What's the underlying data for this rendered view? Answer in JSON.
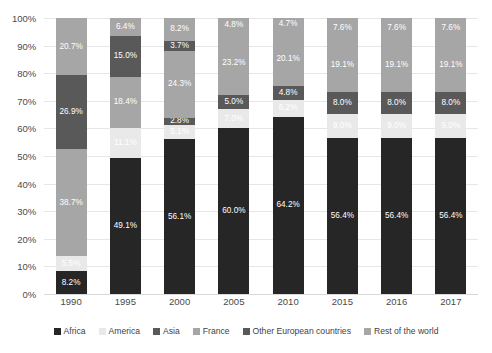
{
  "chart_data": {
    "type": "bar",
    "subtype": "stacked-100-percent",
    "title": "",
    "xlabel": "",
    "ylabel": "",
    "ylim": [
      0,
      100
    ],
    "ytick_labels": [
      "0%",
      "10%",
      "20%",
      "30%",
      "40%",
      "50%",
      "60%",
      "70%",
      "80%",
      "90%",
      "100%"
    ],
    "ytick_values": [
      0,
      10,
      20,
      30,
      40,
      50,
      60,
      70,
      80,
      90,
      100
    ],
    "grid": true,
    "legend_position": "bottom",
    "categories": [
      "1990",
      "1995",
      "2000",
      "2005",
      "2010",
      "2015",
      "2016",
      "2017"
    ],
    "series": [
      {
        "name": "Africa",
        "color": "#262626",
        "values": [
          8.2,
          49.1,
          56.1,
          60.0,
          64.2,
          56.4,
          56.4,
          56.4
        ],
        "labels": [
          "8.2%",
          "49.1%",
          "56.1%",
          "60.0%",
          "64.2%",
          "56.4%",
          "56.4%",
          "56.4%"
        ]
      },
      {
        "name": "America",
        "color": "#e9e9e9",
        "values": [
          5.5,
          11.1,
          5.1,
          7.0,
          6.2,
          9.0,
          9.0,
          9.0
        ],
        "labels": [
          "5.5%",
          "11.1%",
          "5.1%",
          "7.0%",
          "6.2%",
          "9.0%",
          "9.0%",
          "9.0%"
        ]
      },
      {
        "name": "Asia",
        "color": "#595959",
        "values": [
          0,
          0,
          2.8,
          5.0,
          4.8,
          8.0,
          8.0,
          8.0
        ],
        "labels": [
          "",
          "",
          "2.8%",
          "5.0%",
          "4.8%",
          "8.0%",
          "8.0%",
          "8.0%"
        ]
      },
      {
        "name": "France",
        "color": "#a6a6a6",
        "values": [
          38.7,
          18.4,
          24.3,
          23.2,
          20.1,
          19.1,
          19.1,
          19.1
        ],
        "labels": [
          "38.7%",
          "18.4%",
          "24.3%",
          "23.2%",
          "20.1%",
          "19.1%",
          "19.1%",
          "19.1%"
        ]
      },
      {
        "name": "Other European countries",
        "color": "#595959",
        "values": [
          26.9,
          15.0,
          3.7,
          0,
          0,
          0,
          0,
          0
        ],
        "labels": [
          "26.9%",
          "15.0%",
          "3.7%",
          "",
          "",
          "",
          "",
          ""
        ]
      },
      {
        "name": "Rest of the world",
        "color": "#a6a6a6",
        "values": [
          20.7,
          6.4,
          8.2,
          4.8,
          4.7,
          7.6,
          7.6,
          7.6
        ],
        "labels": [
          "20.7%",
          "6.4%",
          "8.2%",
          "4.8%",
          "4.7%",
          "7.6%",
          "7.6%",
          "7.6%"
        ]
      }
    ],
    "legend": [
      {
        "label": "Africa",
        "color": "#262626"
      },
      {
        "label": "America",
        "color": "#e9e9e9"
      },
      {
        "label": "Asia",
        "color": "#595959"
      },
      {
        "label": "France",
        "color": "#a6a6a6"
      },
      {
        "label": "Other European countries",
        "color": "#595959"
      },
      {
        "label": "Rest of the world",
        "color": "#a6a6a6"
      }
    ]
  }
}
